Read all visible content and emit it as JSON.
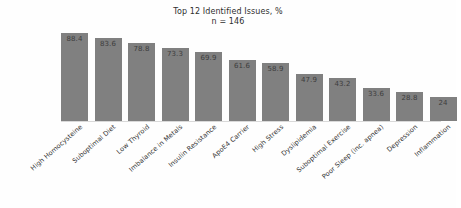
{
  "chart_data": {
    "type": "bar",
    "title": "Top 12 Identified Issues, %",
    "subtitle": "n = 146",
    "xlabel": "",
    "ylabel": "",
    "ylim": [
      0,
      100
    ],
    "grid": false,
    "legend": false,
    "bar_color": "#808080",
    "value_label_color": "#3d3d3d",
    "categories": [
      "High Homocysteine",
      "Suboptimal Diet",
      "Low Thyroid",
      "Imbalance in Metals",
      "Insulin Resistance",
      "ApoE4 Carrier",
      "High Stress",
      "Dyslipidemia",
      "Suboptimal Exercise",
      "Poor Sleep (inc. apnea)",
      "Depression",
      "Inflammation"
    ],
    "values": [
      88.4,
      83.6,
      78.8,
      73.3,
      69.9,
      61.6,
      58.9,
      47.9,
      43.2,
      33.6,
      28.8,
      24
    ],
    "value_labels": [
      "88.4",
      "83.6",
      "78.8",
      "73.3",
      "69.9",
      "61.6",
      "58.9",
      "47.9",
      "43.2",
      "33.6",
      "28.8",
      "24"
    ]
  }
}
